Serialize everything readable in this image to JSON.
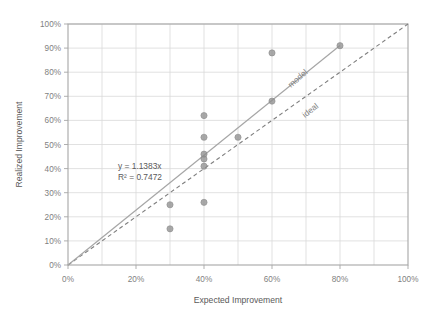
{
  "chart_data": {
    "type": "scatter",
    "title": "",
    "xlabel": "Expected Improvement",
    "ylabel": "Realized Improvement",
    "xlim": [
      0,
      100
    ],
    "ylim": [
      0,
      100
    ],
    "grid": true,
    "legend_position": "inline-annotations",
    "x_ticks": [
      "0%",
      "20%",
      "40%",
      "60%",
      "80%",
      "100%"
    ],
    "x_tick_values": [
      0,
      20,
      40,
      60,
      80,
      100
    ],
    "y_ticks": [
      "0%",
      "10%",
      "20%",
      "30%",
      "40%",
      "50%",
      "60%",
      "70%",
      "80%",
      "90%",
      "100%"
    ],
    "y_tick_values": [
      0,
      10,
      20,
      30,
      40,
      50,
      60,
      70,
      80,
      90,
      100
    ],
    "points": [
      {
        "x": 30,
        "y": 25
      },
      {
        "x": 30,
        "y": 15
      },
      {
        "x": 40,
        "y": 62
      },
      {
        "x": 40,
        "y": 53
      },
      {
        "x": 40,
        "y": 46
      },
      {
        "x": 40,
        "y": 44
      },
      {
        "x": 40,
        "y": 41
      },
      {
        "x": 40,
        "y": 26
      },
      {
        "x": 50,
        "y": 53
      },
      {
        "x": 60,
        "y": 88
      },
      {
        "x": 60,
        "y": 68
      },
      {
        "x": 80,
        "y": 91
      }
    ],
    "series": [
      {
        "name": "model",
        "type": "line",
        "style": "solid",
        "slope": 1.1383,
        "intercept": 0,
        "label": "model"
      },
      {
        "name": "ideal",
        "type": "line",
        "style": "dashed",
        "slope": 1.0,
        "intercept": 0,
        "label": "ideal"
      }
    ],
    "annotations": {
      "equation": "y = 1.1383x",
      "r_squared": "R² = 0.7472"
    },
    "colors": {
      "marker": "#8c8c8c",
      "model_line": "#a6a6a6",
      "ideal_line": "#7f7f7f",
      "grid": "#d9d9d9",
      "axis": "#a6a6a6",
      "text": "#595959"
    }
  }
}
